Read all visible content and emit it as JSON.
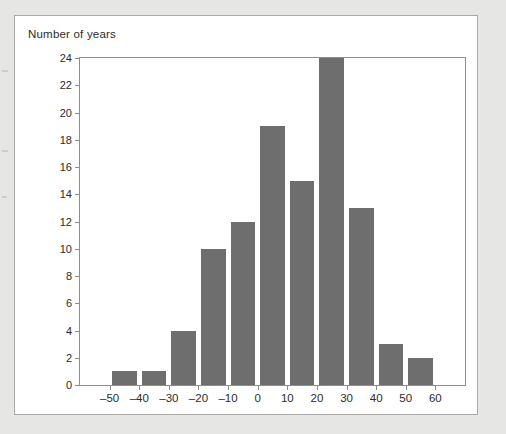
{
  "figure": {
    "title": "Number of years"
  },
  "chart_data": {
    "type": "bar",
    "title": "Number of years",
    "xlabel": "",
    "ylabel": "Number of years",
    "grid": false,
    "legend": null,
    "bin_width": 10,
    "xlim": [
      -60,
      70
    ],
    "ylim": [
      0,
      24
    ],
    "x_ticks": [
      "–50",
      "–40",
      "–30",
      "–20",
      "–10",
      "0",
      "10",
      "20",
      "30",
      "40",
      "50",
      "60"
    ],
    "x_tick_values": [
      -50,
      -40,
      -30,
      -20,
      -10,
      0,
      10,
      20,
      30,
      40,
      50,
      60
    ],
    "y_ticks": [
      "0",
      "2",
      "4",
      "6",
      "8",
      "10",
      "12",
      "14",
      "16",
      "18",
      "20",
      "22",
      "24"
    ],
    "y_tick_values": [
      0,
      2,
      4,
      6,
      8,
      10,
      12,
      14,
      16,
      18,
      20,
      22,
      24
    ],
    "bin_edges": [
      -50,
      -40,
      -30,
      -20,
      -10,
      0,
      10,
      20,
      30,
      40,
      50,
      60
    ],
    "categories": [
      "–50 to –40",
      "–40 to –30",
      "–30 to –20",
      "–20 to –10",
      "–10 to 0",
      "0 to 10",
      "10 to 20",
      "20 to 30",
      "30 to 40",
      "40 to 50",
      "50 to 60"
    ],
    "values": [
      1,
      1,
      4,
      10,
      12,
      19,
      15,
      24,
      13,
      3,
      2
    ],
    "bar_color": "#6e6e6e"
  }
}
